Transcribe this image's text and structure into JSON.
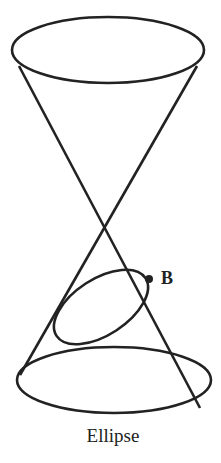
{
  "diagram": {
    "type": "double cone with conic section",
    "point_label": "B",
    "caption": "Ellipse",
    "stroke_color": "#222222"
  }
}
